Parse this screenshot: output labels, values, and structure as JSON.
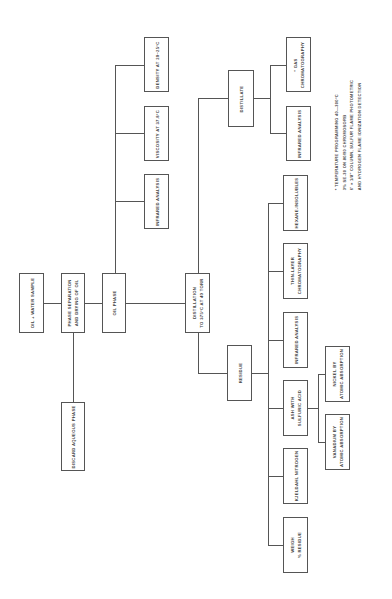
{
  "diagram": {
    "orientation": "rotated 90 degrees counter-clockwise (text reads bottom-to-top)",
    "nodes": {
      "sample": {
        "line1": "OIL + WATER SAMPLE"
      },
      "phase_sep": {
        "line1": "PHASE SEPARATION",
        "line2": "AND DRYING OF OIL"
      },
      "discard": {
        "line1": "DISCARD AQUEOUS PHASE"
      },
      "oil_phase": {
        "line1": "OIL PHASE"
      },
      "oil_ir": {
        "line1": "INFRARED ANALYSIS"
      },
      "viscosity": {
        "line1": "VISCOSITY AT 37.8°C"
      },
      "density": {
        "line1": "DENSITY AT 20–25°C"
      },
      "distillation": {
        "line1": "DISTILLATION",
        "line2": "TO 375°C AT 40 TORR"
      },
      "residue": {
        "line1": "RESIDUE"
      },
      "distillate": {
        "line1": "DISTILLATE"
      },
      "weigh": {
        "line1": "WEIGH",
        "line2": "% RESIDUE"
      },
      "kjeldahl": {
        "line1": "KJELDAHL NITROGEN"
      },
      "ash": {
        "line1": "ASH WITH",
        "line2": "SULFURIC ACID"
      },
      "res_ir": {
        "line1": "INFRARED ANALYSIS"
      },
      "tlc": {
        "line1": "THIN-LAYER",
        "line2": "CHROMATOGRAPHY"
      },
      "hexane": {
        "line1": "HEXANE-INSOLUBLES"
      },
      "nickel": {
        "line1": "NICKEL BY",
        "line2": "ATOMIC ABSORPTION"
      },
      "vanadium": {
        "line1": "VANADIUM BY",
        "line2": "ATOMIC ABSORPTION"
      },
      "dist_ir": {
        "line1": "INFRARED ANALYSIS"
      },
      "gc": {
        "line1": "* GAS",
        "line2": "CHROMATOGRAPHY"
      }
    },
    "footnote": [
      "* TEMPERATURE PROGRAMMING 40—300°C",
      "3% SE-30 ON 80/90 CHROMOSORB",
      "6' × 1/8\" COLUMN, SULFUR FLAME PHOTOMETRIC",
      "AND HYDROGEN FLAME IONIZATION DETECTION"
    ]
  }
}
